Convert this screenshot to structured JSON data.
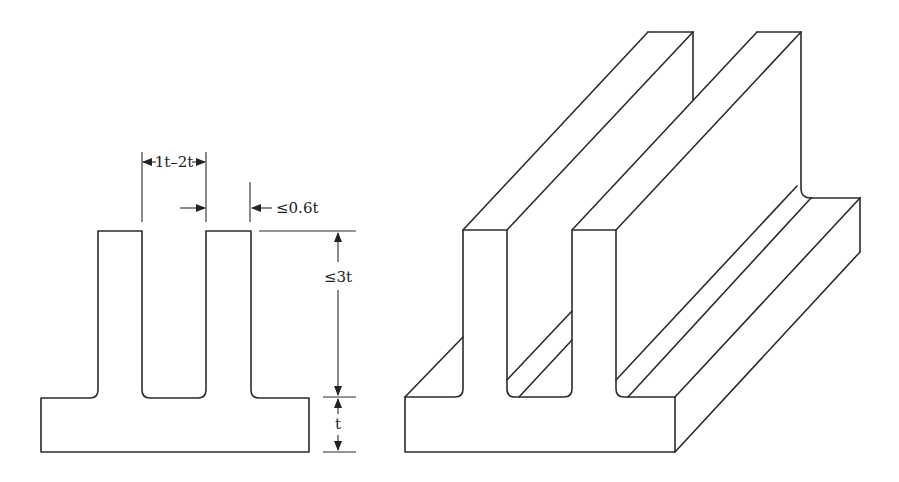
{
  "figure": {
    "stroke_color": "#2b2b2b",
    "background": "#ffffff"
  },
  "cross_section": {
    "dimensions": {
      "fin_gap": "1t–2t",
      "fin_thickness": "≤0.6t",
      "fin_height": "≤3t",
      "base_thickness": "t"
    }
  },
  "isometric_view": {
    "fins": 2
  }
}
